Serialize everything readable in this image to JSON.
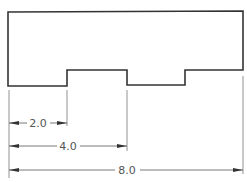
{
  "diagram": {
    "type": "technical-drawing",
    "part": {
      "outline_color": "#333333",
      "points": [
        [
          8,
          12
        ],
        [
          243,
          11
        ],
        [
          243,
          70
        ],
        [
          185,
          70
        ],
        [
          185,
          85
        ],
        [
          127,
          85
        ],
        [
          127,
          70
        ],
        [
          67,
          70
        ],
        [
          67,
          86
        ],
        [
          8,
          86
        ]
      ]
    },
    "dimensions": [
      {
        "label": "2.0",
        "x1": 9,
        "x2": 67,
        "y": 123
      },
      {
        "label": "4.0",
        "x1": 9,
        "x2": 127,
        "y": 146
      },
      {
        "label": "8.0",
        "x1": 9,
        "x2": 243,
        "y": 170
      }
    ],
    "extension_lines": [
      {
        "x": 9,
        "y1": 90,
        "y2": 178
      },
      {
        "x": 67,
        "y1": 90,
        "y2": 126
      },
      {
        "x": 127,
        "y1": 90,
        "y2": 151
      },
      {
        "x": 243,
        "y1": 76,
        "y2": 174
      }
    ]
  }
}
